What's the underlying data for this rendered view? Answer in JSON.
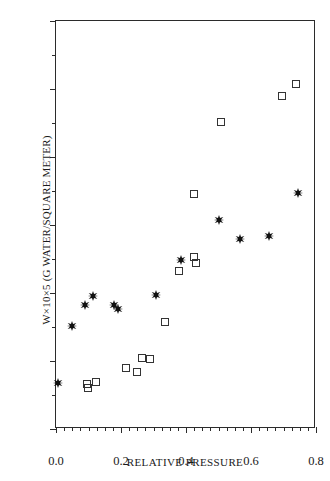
{
  "chart_data": {
    "type": "scatter",
    "title": "",
    "xlabel": "RELATIVE PRESSURE",
    "ylabel": "W×10×5 (G WATER/SQUARE METER)",
    "xlim": [
      0.0,
      0.8
    ],
    "ylim": [
      0,
      60
    ],
    "grid": false,
    "legend": "none",
    "xticks": [
      0.0,
      0.2,
      0.4,
      0.6,
      0.8
    ],
    "xtick_labels": [
      "0.0",
      "0.2",
      "0.4",
      "0.6",
      "0.8"
    ],
    "xminor_step": 0.025,
    "yticks": [
      0,
      10,
      20,
      30,
      40,
      50,
      60
    ],
    "ytick_labels": [
      "0",
      "10",
      "20",
      "30",
      "40",
      "50",
      "60"
    ],
    "yminor_step": 5,
    "series": [
      {
        "name": "filled-star-series",
        "marker": "star-filled",
        "color": "#111111",
        "points": [
          {
            "x": 0.005,
            "y": 6.8
          },
          {
            "x": 0.048,
            "y": 15.1
          },
          {
            "x": 0.088,
            "y": 18.2
          },
          {
            "x": 0.115,
            "y": 19.5
          },
          {
            "x": 0.178,
            "y": 18.2
          },
          {
            "x": 0.192,
            "y": 17.7
          },
          {
            "x": 0.308,
            "y": 19.7
          },
          {
            "x": 0.385,
            "y": 24.8
          },
          {
            "x": 0.5,
            "y": 30.8
          },
          {
            "x": 0.565,
            "y": 27.9
          },
          {
            "x": 0.655,
            "y": 28.4
          },
          {
            "x": 0.745,
            "y": 34.7
          }
        ]
      },
      {
        "name": "open-square-series",
        "marker": "square-open",
        "color": "#333333",
        "points": [
          {
            "x": 0.095,
            "y": 6.6
          },
          {
            "x": 0.098,
            "y": 6.1
          },
          {
            "x": 0.122,
            "y": 6.9
          },
          {
            "x": 0.215,
            "y": 8.9
          },
          {
            "x": 0.248,
            "y": 8.4
          },
          {
            "x": 0.265,
            "y": 10.4
          },
          {
            "x": 0.288,
            "y": 10.3
          },
          {
            "x": 0.335,
            "y": 15.7
          },
          {
            "x": 0.378,
            "y": 23.2
          },
          {
            "x": 0.425,
            "y": 25.3
          },
          {
            "x": 0.43,
            "y": 24.4
          },
          {
            "x": 0.425,
            "y": 34.5
          },
          {
            "x": 0.508,
            "y": 45.2
          },
          {
            "x": 0.695,
            "y": 49.0
          },
          {
            "x": 0.738,
            "y": 50.8
          }
        ]
      }
    ]
  }
}
